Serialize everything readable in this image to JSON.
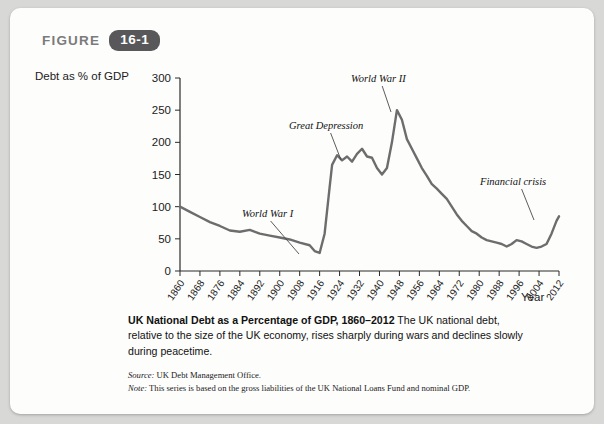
{
  "figure": {
    "word": "FIGURE",
    "number": "16-1"
  },
  "caption": {
    "title": "UK National Debt as a Percentage of GDP, 1860–2012",
    "body": "The UK national debt, relative to the size of the UK economy, rises sharply during wars and declines slowly during peacetime."
  },
  "notes": {
    "source_label": "Source:",
    "source_text": "UK Debt Management Office.",
    "note_label": "Note:",
    "note_text": "This series is based on the gross liabilities of the UK National Loans Fund and nominal GDP."
  },
  "chart_data": {
    "type": "line",
    "title": "UK National Debt as a Percentage of GDP, 1860–2012",
    "xlabel": "Year",
    "ylabel": "Debt as % of GDP",
    "xlim": [
      1860,
      2012
    ],
    "ylim": [
      0,
      300
    ],
    "yticks": [
      0,
      50,
      100,
      150,
      200,
      250,
      300
    ],
    "xticks": [
      1860,
      1868,
      1876,
      1884,
      1892,
      1900,
      1908,
      1916,
      1924,
      1932,
      1940,
      1948,
      1956,
      1964,
      1972,
      1980,
      1988,
      1996,
      2004,
      2012
    ],
    "grid": false,
    "legend": false,
    "line_color": "#6d6d6d",
    "annotations": [
      {
        "text": "World War I",
        "x": 1914,
        "y": 28
      },
      {
        "text": "Great Depression",
        "x": 1931,
        "y": 180
      },
      {
        "text": "World War II",
        "x": 1944,
        "y": 250
      },
      {
        "text": "Financial crisis",
        "x": 2009,
        "y": 65
      }
    ],
    "x": [
      1860,
      1864,
      1868,
      1872,
      1876,
      1880,
      1884,
      1888,
      1892,
      1896,
      1900,
      1904,
      1908,
      1912,
      1914,
      1916,
      1918,
      1920,
      1921,
      1923,
      1925,
      1927,
      1929,
      1931,
      1933,
      1935,
      1937,
      1939,
      1941,
      1943,
      1945,
      1947,
      1949,
      1951,
      1953,
      1955,
      1957,
      1959,
      1961,
      1963,
      1965,
      1967,
      1969,
      1971,
      1973,
      1975,
      1977,
      1979,
      1981,
      1983,
      1985,
      1987,
      1989,
      1991,
      1993,
      1995,
      1997,
      1999,
      2001,
      2003,
      2005,
      2007,
      2009,
      2011,
      2012
    ],
    "y": [
      100,
      92,
      84,
      76,
      70,
      63,
      61,
      64,
      58,
      55,
      52,
      49,
      44,
      40,
      31,
      28,
      58,
      130,
      165,
      180,
      172,
      178,
      170,
      182,
      190,
      178,
      176,
      160,
      150,
      160,
      200,
      250,
      235,
      205,
      190,
      175,
      160,
      148,
      135,
      128,
      120,
      112,
      100,
      88,
      78,
      70,
      62,
      58,
      52,
      48,
      46,
      44,
      42,
      38,
      42,
      48,
      46,
      42,
      38,
      36,
      38,
      42,
      58,
      78,
      85
    ]
  }
}
